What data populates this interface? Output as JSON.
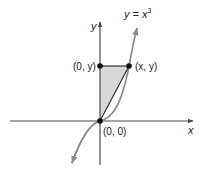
{
  "diagram": {
    "curve_label": "y = x",
    "curve_label_exp": "3",
    "y_axis_label": "y",
    "x_axis_label": "x",
    "points": [
      {
        "label": "(0, y)",
        "role": "point-on-y-axis"
      },
      {
        "label": "(x, y)",
        "role": "point-on-curve"
      },
      {
        "label": "(0, 0)",
        "role": "origin"
      }
    ],
    "colors": {
      "axis": "#4a4a4a",
      "curve": "#8a8a8a",
      "shade": "#d8d8d8",
      "point": "#111111"
    }
  }
}
